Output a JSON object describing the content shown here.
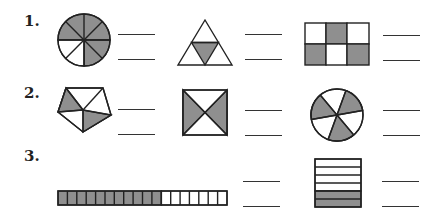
{
  "worksheet": {
    "problems": [
      {
        "number_label": "1.",
        "figures": [
          {
            "shape": "circle",
            "parts": 8,
            "shaded": 6,
            "answer_top": "",
            "answer_bottom": ""
          },
          {
            "shape": "triangle",
            "parts": 4,
            "shaded": 1,
            "answer_top": "",
            "answer_bottom": ""
          },
          {
            "shape": "rectangle-grid-3x2",
            "parts": 6,
            "shaded": 3,
            "answer_top": "",
            "answer_bottom": ""
          }
        ]
      },
      {
        "number_label": "2.",
        "figures": [
          {
            "shape": "pentagon",
            "parts": 5,
            "shaded": 2,
            "answer_top": "",
            "answer_bottom": ""
          },
          {
            "shape": "square-diagonals",
            "parts": 4,
            "shaded": 2,
            "answer_top": "",
            "answer_bottom": ""
          },
          {
            "shape": "circle",
            "parts": 6,
            "shaded": 3,
            "answer_top": "",
            "answer_bottom": ""
          }
        ]
      },
      {
        "number_label": "3.",
        "figures": [
          {
            "shape": "horizontal-bar",
            "parts": 18,
            "shaded": 11,
            "answer_top": "",
            "answer_bottom": ""
          },
          {
            "shape": "stacked-rows",
            "parts": 6,
            "shaded": 2,
            "answer_top": "",
            "answer_bottom": ""
          }
        ]
      }
    ],
    "colors": {
      "shade": "#8f8f8f",
      "stroke": "#222222",
      "background": "#ffffff"
    }
  }
}
